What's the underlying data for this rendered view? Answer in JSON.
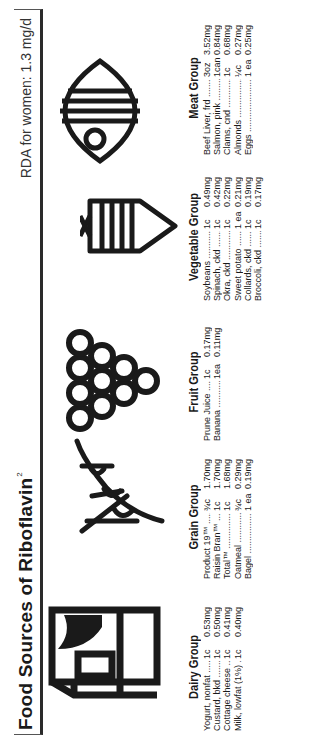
{
  "header": {
    "title": "Food Sources of Riboflavin",
    "title_superscript": "2",
    "rda": "RDA for women: 1.3 mg/d"
  },
  "groups": [
    {
      "title": "Dairy Group",
      "icon": "milk-carton-icon",
      "items": [
        {
          "name": "Yogurt, nonfat",
          "qty": "1c",
          "amount": "0.53mg"
        },
        {
          "name": "Custard, bkd",
          "qty": "1c",
          "amount": "0.50mg"
        },
        {
          "name": "Cottage cheese",
          "qty": "1c",
          "amount": "0.41mg"
        },
        {
          "name": "Milk, lowfat (1%)",
          "qty": "1c",
          "amount": "0.40mg"
        }
      ]
    },
    {
      "title": "Grain Group",
      "icon": "wheat-stalk-icon",
      "items": [
        {
          "name": "Product 19™",
          "qty": "¾c",
          "amount": "1.70mg"
        },
        {
          "name": "Raisin Bran™",
          "qty": "1c",
          "amount": "1.70mg"
        },
        {
          "name": "Total™",
          "qty": "1c",
          "amount": "1.68mg"
        },
        {
          "name": "Oatmeal",
          "qty": "¾c",
          "amount": "0.29mg"
        },
        {
          "name": "Bagel",
          "qty": "1 ea",
          "amount": "0.19mg"
        }
      ]
    },
    {
      "title": "Fruit Group",
      "icon": "grapes-icon",
      "items": [
        {
          "name": "Prune Juice",
          "qty": "1c",
          "amount": "0.17mg"
        },
        {
          "name": "Banana",
          "qty": "1ea",
          "amount": "0.11mg"
        }
      ]
    },
    {
      "title": "Vegetable Group",
      "icon": "carrot-icon",
      "items": [
        {
          "name": "Soybeans",
          "qty": "1c",
          "amount": "0.49mg"
        },
        {
          "name": "Spinach, ckd",
          "qty": "1c",
          "amount": "0.42mg"
        },
        {
          "name": "Okra, ckd",
          "qty": "1c",
          "amount": "0.22mg"
        },
        {
          "name": "Sweet potato",
          "qty": "1 ea",
          "amount": "0.21mg"
        },
        {
          "name": "Collards, ckd",
          "qty": "1c",
          "amount": "0.19mg"
        },
        {
          "name": "Broccoli, ckd",
          "qty": "1c",
          "amount": "0.17mg"
        }
      ]
    },
    {
      "title": "Meat Group",
      "icon": "fish-icon",
      "items": [
        {
          "name": "Beef Liver, frd",
          "qty": "3oz",
          "amount": "3.52mg"
        },
        {
          "name": "Salmon, pink",
          "qty": "1can",
          "amount": "0.84mg"
        },
        {
          "name": "Clams, cnd",
          "qty": "1c",
          "amount": "0.68mg"
        },
        {
          "name": "Almonds",
          "qty": "¼c",
          "amount": "0.27mg"
        },
        {
          "name": "Eggs",
          "qty": "1 ea",
          "amount": "0.25mg"
        }
      ]
    }
  ]
}
